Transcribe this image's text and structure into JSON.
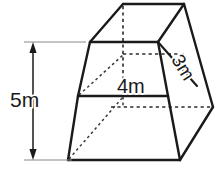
{
  "figure": {
    "kind": "geometry-diagram",
    "shape_name": "truncated-square-pyramid-frustum",
    "background_color": "#ffffff",
    "line_color": "#1a1a1a",
    "canvas": {
      "width": 223,
      "height": 191
    },
    "labels": {
      "height": "5m",
      "top_width": "4m",
      "top_depth": "3m"
    },
    "measurements": [
      {
        "name": "height",
        "value": 5,
        "unit": "m",
        "text": "5m",
        "orientation": "vertical",
        "position": {
          "x": 33,
          "y": 101
        }
      },
      {
        "name": "top_width",
        "value": 4,
        "unit": "m",
        "text": "4m",
        "orientation": "horizontal",
        "position": {
          "x": 135,
          "y": 88
        }
      },
      {
        "name": "top_depth",
        "value": 3,
        "unit": "m",
        "text": "3m",
        "orientation": "diagonal",
        "rotation_deg": 58,
        "position": {
          "x": 182,
          "y": 68
        }
      }
    ],
    "vertices": {
      "top_back_left": {
        "x": 123,
        "y": 4
      },
      "top_back_right": {
        "x": 184,
        "y": 4
      },
      "top_front_right": {
        "x": 158,
        "y": 42
      },
      "top_front_left": {
        "x": 90,
        "y": 42
      },
      "mid_front_left": {
        "x": 78,
        "y": 96
      },
      "mid_front_right": {
        "x": 168,
        "y": 96
      },
      "mid_back_left": {
        "x": 111,
        "y": 107
      },
      "mid_back_right": {
        "x": 213,
        "y": 107
      },
      "bottom_front_left": {
        "x": 68,
        "y": 160
      },
      "bottom_front_right": {
        "x": 180,
        "y": 160
      }
    },
    "dimension_arrow": {
      "x": 33,
      "top_y": 42,
      "bottom_y": 160,
      "tick_top_x_end": 86,
      "tick_bottom_x_end": 72
    }
  }
}
